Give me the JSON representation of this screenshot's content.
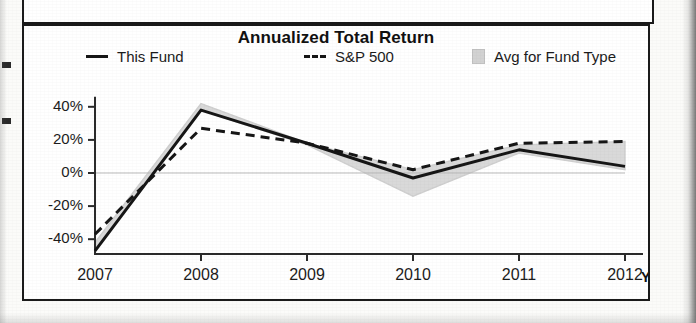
{
  "chart_panel": {
    "title": "Annualized Total Return",
    "legend": [
      {
        "label": "This Fund",
        "marker": "solid-line-swatch"
      },
      {
        "label": "S&P 500",
        "marker": "dashed-line-swatch"
      },
      {
        "label": "Avg for Fund Type",
        "marker": "gray-area-swatch"
      }
    ],
    "x_axis_suffix": "YTD"
  },
  "chart_data": {
    "type": "line",
    "title": "Annualized Total Return",
    "xlabel": "",
    "ylabel": "",
    "categories": [
      "2007",
      "2008",
      "2009",
      "2010",
      "2011",
      "2012"
    ],
    "x_tick_labels": [
      "2007",
      "2008",
      "2009",
      "2010",
      "2011",
      "2012"
    ],
    "x_axis_note": "YTD",
    "y_tick_labels": [
      "40%",
      "20%",
      "0%",
      "-20%",
      "-40%"
    ],
    "y_ticks": [
      40,
      20,
      0,
      -20,
      -40
    ],
    "ylim": [
      -50,
      45
    ],
    "y_unit": "%",
    "grid": false,
    "zero_line": true,
    "legend_position": "top",
    "series": [
      {
        "name": "This Fund",
        "style": "solid",
        "color": "#161616",
        "values": [
          -47,
          38,
          18,
          -3,
          14,
          4
        ]
      },
      {
        "name": "S&P 500",
        "style": "dashed",
        "color": "#161616",
        "values": [
          -37,
          27,
          18,
          2,
          18,
          19
        ]
      },
      {
        "name": "Avg for Fund Type",
        "style": "area-band",
        "color": "#d9d9d9",
        "upper": [
          -42,
          42,
          18,
          2,
          17,
          19
        ],
        "lower": [
          -47,
          38,
          17,
          -14,
          12,
          2
        ]
      }
    ]
  }
}
